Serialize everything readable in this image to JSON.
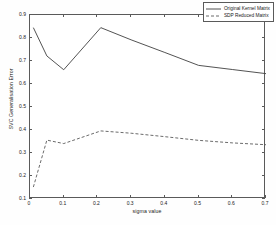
{
  "chart_data": {
    "type": "line",
    "title": "",
    "xlabel": "sigma value",
    "ylabel": "SVC Generalisation Error",
    "xlim": [
      0,
      0.7
    ],
    "ylim": [
      0.1,
      0.9
    ],
    "xticks": [
      "0",
      "0.1",
      "0.2",
      "0.3",
      "0.4",
      "0.5",
      "0.6",
      "0.7"
    ],
    "xtick_values": [
      0,
      0.1,
      0.2,
      0.3,
      0.4,
      0.5,
      0.6,
      0.7
    ],
    "yticks": [
      "0.1",
      "0.2",
      "0.3",
      "0.4",
      "0.5",
      "0.6",
      "0.7",
      "0.8",
      "0.9"
    ],
    "ytick_values": [
      0.1,
      0.2,
      0.3,
      0.4,
      0.5,
      0.6,
      0.7,
      0.8,
      0.9
    ],
    "grid": false,
    "legend_position": "top-right",
    "series": [
      {
        "name": "Original Kernel Matrix",
        "style": "solid",
        "color": "#404040",
        "x": [
          0.01,
          0.05,
          0.1,
          0.21,
          0.3,
          0.4,
          0.5,
          0.6,
          0.7
        ],
        "values": [
          0.845,
          0.722,
          0.662,
          0.845,
          0.792,
          0.737,
          0.681,
          0.663,
          0.645
        ]
      },
      {
        "name": "SDP Reduced Matrix",
        "style": "dashed",
        "color": "#404040",
        "x": [
          0.01,
          0.05,
          0.1,
          0.21,
          0.3,
          0.4,
          0.5,
          0.6,
          0.7
        ],
        "values": [
          0.152,
          0.356,
          0.341,
          0.396,
          0.386,
          0.371,
          0.355,
          0.344,
          0.336
        ]
      }
    ]
  },
  "legend": {
    "items": [
      {
        "label": "Original Kernel Matrix",
        "style": "solid"
      },
      {
        "label": "SDP Reduced Matrix",
        "style": "dashed"
      }
    ]
  }
}
